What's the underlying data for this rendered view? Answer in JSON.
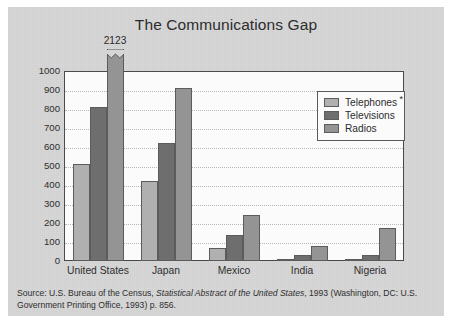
{
  "chart_data": {
    "type": "bar",
    "title": "The Communications Gap",
    "xlabel": "",
    "ylabel": "Number of appliances per 1000 people",
    "ylim": [
      0,
      1000
    ],
    "ytick_step": 100,
    "grid": true,
    "legend_position": "upper-right-inside",
    "categories": [
      "United States",
      "Japan",
      "Mexico",
      "India",
      "Nigeria"
    ],
    "series": [
      {
        "name": "Telephones",
        "color": "#b0b0b0",
        "values": [
          510,
          421,
          66,
          8,
          3
        ]
      },
      {
        "name": "Televisions",
        "color": "#6e6e6e",
        "values": [
          812,
          620,
          139,
          32,
          33
        ]
      },
      {
        "name": "Radios",
        "color": "#949494",
        "values": [
          2123,
          911,
          242,
          81,
          172
        ]
      }
    ],
    "ytick_labels": [
      "1000",
      "900",
      "800",
      "700",
      "600",
      "500",
      "400",
      "300",
      "200",
      "100",
      "0"
    ],
    "annotations": [
      {
        "text": "2123",
        "series": "Radios",
        "category": "United States",
        "note": "bar is truncated with a zigzag break above the 1000 axis maximum"
      }
    ]
  },
  "legend": {
    "items": [
      {
        "label": "Telephones",
        "asterisk": "*"
      },
      {
        "label": "Televisions",
        "asterisk": ""
      },
      {
        "label": "Radios",
        "asterisk": ""
      }
    ]
  },
  "source": {
    "line1_prefix": "Source: U.S. Bureau of the Census, ",
    "line1_italic": "Statistical Abstract of the United States",
    "line1_suffix": ", 1993 (Washington, DC:",
    "line2": "U.S. Government Printing Office, 1993) p. 856."
  },
  "colors": {
    "card_background": "#d6d6d6",
    "plot_background": "#fbfbfb",
    "axis": "#4a4a4a",
    "gridline": "#b9b9b9",
    "text": "#2e2e2e"
  }
}
